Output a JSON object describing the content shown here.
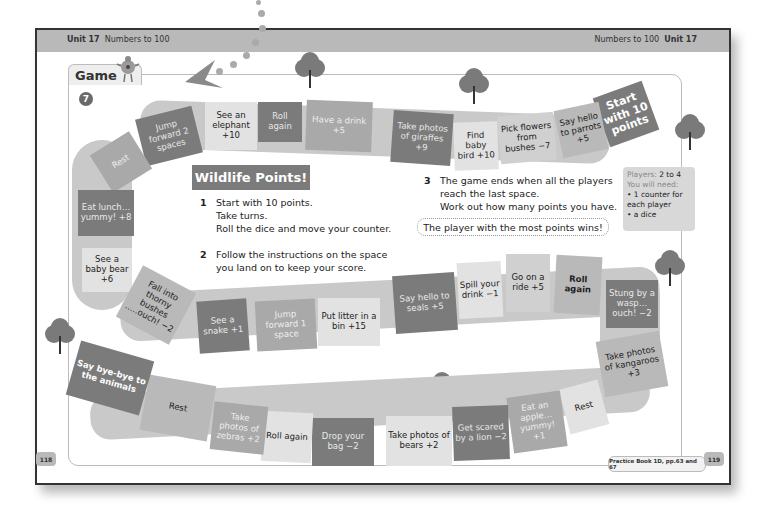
{
  "header": {
    "left_unit": "Unit 17",
    "left_topic": "Numbers to 100",
    "right_topic": "Numbers to 100",
    "right_unit": "Unit 17"
  },
  "section": {
    "label": "Game",
    "number": "7"
  },
  "game": {
    "title": "Wildlife Points!",
    "instructions": [
      {
        "num": "1",
        "lines": [
          "Start with 10 points.",
          "Take turns.",
          "Roll the dice and move your counter."
        ]
      },
      {
        "num": "2",
        "lines": [
          "Follow the instructions on the space",
          "you land on to keep your score."
        ]
      },
      {
        "num": "3",
        "lines": [
          "The game ends when all the players",
          "reach the last space.",
          "Work out how many points you have."
        ]
      }
    ],
    "winner_note": "The player with the most points wins!",
    "players": {
      "players_label": "Players:",
      "players_value": "2 to 4",
      "need_label": "You will need:",
      "items": [
        "1 counter for each player",
        "a dice"
      ]
    }
  },
  "spaces": [
    "Start with 10 points",
    "Say hello to parrots +5",
    "Pick flowers from bushes −7",
    "Find baby bird +10",
    "Take photos of giraffes +9",
    "Have a drink +5",
    "Roll again",
    "See an elephant +10",
    "Jump forward 2 spaces",
    "Rest",
    "Eat lunch… yummy! +8",
    "See a baby bear +6",
    "Fall into thorny bushes …..ouch! −2",
    "See a snake +1",
    "Jump forward 1 space",
    "Put litter in a bin +15",
    "Say hello to seals +5",
    "Spill your drink −1",
    "Go on a ride +5",
    "Roll again",
    "Stung by a wasp… ouch! −2",
    "Take photos of kangaroos +3",
    "Rest",
    "Eat an apple… yummy! +1",
    "Get scared by a lion −2",
    "Take photos of bears +2",
    "Drop your bag −2",
    "Roll again",
    "Take photos of zebras +2",
    "Rest",
    "Say bye-bye to the animals"
  ],
  "footer": {
    "practice_ref": "Practice Book 1D, pp.63 and 67",
    "page_left": "118",
    "page_right": "119"
  }
}
